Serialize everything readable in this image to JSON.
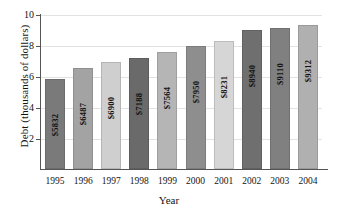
{
  "chart_data": {
    "type": "bar",
    "title": "",
    "xlabel": "Year",
    "ylabel": "Debt (thousands of dollars)",
    "categories": [
      "1995",
      "1996",
      "1997",
      "1998",
      "1999",
      "2000",
      "2001",
      "2002",
      "2003",
      "2004"
    ],
    "values": [
      5832,
      6487,
      6900,
      7188,
      7564,
      7950,
      8231,
      8940,
      9110,
      9312
    ],
    "value_labels": [
      "$5832",
      "$6487",
      "$6900",
      "$7188",
      "$7564",
      "$7950",
      "$8231",
      "$8940",
      "$9110",
      "$9312"
    ],
    "value_scale_divisor": 1000,
    "ylim": [
      0,
      10
    ],
    "yticks": [
      2,
      4,
      6,
      8,
      10
    ],
    "ytick_labels": [
      "2",
      "4",
      "6",
      "8",
      "10"
    ],
    "grid": true,
    "grid_axis": "y",
    "legend": "none",
    "bar_colors": [
      "#7a7a7a",
      "#a3a3a3",
      "#cfcfcf",
      "#6a6a6a",
      "#b5b5b5",
      "#8e8e8e",
      "#d6d6d6",
      "#6f6f6f",
      "#808080",
      "#b0b0b0"
    ],
    "axis_color": "#555555",
    "grid_color": "#e2e2e2",
    "background_color": "#ffffff"
  }
}
